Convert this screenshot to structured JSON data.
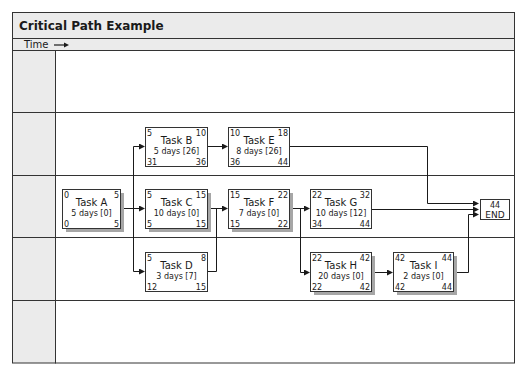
{
  "title": "Critical Path Example",
  "time_label": "Time",
  "colors": {
    "header_bg": "#ebebeb",
    "lane_label_bg": "#ebebeb",
    "border": "#333333",
    "shadow": "#a6a6a6",
    "box_bg": "#ffffff"
  },
  "lanes": 5,
  "tasks": [
    {
      "id": "A",
      "name": "Task A",
      "duration": "5 days [0]",
      "es": "0",
      "ef": "5",
      "ls": "0",
      "lf": "5",
      "critical": true
    },
    {
      "id": "B",
      "name": "Task B",
      "duration": "5 days [26]",
      "es": "5",
      "ef": "10",
      "ls": "31",
      "lf": "36",
      "critical": false
    },
    {
      "id": "C",
      "name": "Task C",
      "duration": "10 days [0]",
      "es": "5",
      "ef": "15",
      "ls": "5",
      "lf": "15",
      "critical": true
    },
    {
      "id": "D",
      "name": "Task D",
      "duration": "3 days [7]",
      "es": "5",
      "ef": "8",
      "ls": "12",
      "lf": "15",
      "critical": false
    },
    {
      "id": "E",
      "name": "Task E",
      "duration": "8 days [26]",
      "es": "10",
      "ef": "18",
      "ls": "36",
      "lf": "44",
      "critical": false
    },
    {
      "id": "F",
      "name": "Task F",
      "duration": "7 days [0]",
      "es": "15",
      "ef": "22",
      "ls": "15",
      "lf": "22",
      "critical": true
    },
    {
      "id": "G",
      "name": "Task G",
      "duration": "10 days [12]",
      "es": "22",
      "ef": "32",
      "ls": "34",
      "lf": "44",
      "critical": false
    },
    {
      "id": "H",
      "name": "Task H",
      "duration": "20 days [0]",
      "es": "22",
      "ef": "42",
      "ls": "22",
      "lf": "42",
      "critical": true
    },
    {
      "id": "I",
      "name": "Task I",
      "duration": "2 days [0]",
      "es": "42",
      "ef": "44",
      "ls": "42",
      "lf": "44",
      "critical": true
    }
  ],
  "end_node": {
    "value": "44",
    "label": "END"
  },
  "dependencies": [
    [
      "A",
      "C"
    ],
    [
      "A",
      "B"
    ],
    [
      "A",
      "D"
    ],
    [
      "B",
      "E"
    ],
    [
      "C",
      "F"
    ],
    [
      "D",
      "F"
    ],
    [
      "F",
      "G"
    ],
    [
      "F",
      "H"
    ],
    [
      "H",
      "I"
    ],
    [
      "E",
      "END"
    ],
    [
      "G",
      "END"
    ],
    [
      "I",
      "END"
    ]
  ]
}
